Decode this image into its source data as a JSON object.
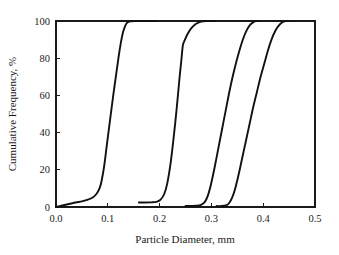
{
  "chart_data": {
    "type": "line",
    "title": "",
    "xlabel": "Particle Diameter, mm",
    "ylabel": "Cumulative Frequency, %",
    "xlim": [
      0.0,
      0.5
    ],
    "ylim": [
      0,
      100
    ],
    "xticks": [
      "0.0",
      "0.1",
      "0.2",
      "0.3",
      "0.4",
      "0.5"
    ],
    "xtick_values": [
      0.0,
      0.1,
      0.2,
      0.3,
      0.4,
      0.5
    ],
    "yticks": [
      "0",
      "20",
      "40",
      "60",
      "80",
      "100"
    ],
    "ytick_values": [
      0,
      20,
      40,
      60,
      80,
      100
    ],
    "grid": false,
    "legend": "none",
    "line_color": "#111111",
    "background_color": "#ffffff",
    "axis_color": "#1a1a1a",
    "series": [
      {
        "name": "Sample 1",
        "x": [
          0.0,
          0.012,
          0.025,
          0.038,
          0.05,
          0.06,
          0.07,
          0.078,
          0.084,
          0.088,
          0.093,
          0.098,
          0.104,
          0.11,
          0.116,
          0.121,
          0.125,
          0.129,
          0.133,
          0.137,
          0.143,
          0.152,
          0.165,
          0.18,
          0.195
        ],
        "y": [
          0.0,
          0.8,
          1.6,
          2.4,
          3.0,
          3.8,
          5.0,
          7.0,
          10.0,
          14.0,
          22.0,
          33.0,
          46.0,
          59.0,
          71.0,
          81.0,
          88.0,
          93.5,
          97.0,
          99.0,
          99.8,
          100.0,
          100.0,
          100.0,
          100.0
        ]
      },
      {
        "name": "Sample 2",
        "x": [
          0.16,
          0.172,
          0.184,
          0.194,
          0.202,
          0.209,
          0.215,
          0.221,
          0.227,
          0.233,
          0.238,
          0.242,
          0.245,
          0.249,
          0.254,
          0.261,
          0.269,
          0.277,
          0.284,
          0.292,
          0.3,
          0.308
        ],
        "y": [
          2.4,
          2.4,
          2.5,
          2.8,
          4.0,
          7.0,
          13.0,
          23.0,
          37.0,
          53.0,
          68.0,
          79.0,
          87.0,
          90.0,
          93.0,
          96.0,
          98.2,
          99.4,
          99.9,
          100.0,
          100.0,
          100.0
        ]
      },
      {
        "name": "Sample 3",
        "x": [
          0.25,
          0.262,
          0.272,
          0.28,
          0.287,
          0.293,
          0.299,
          0.306,
          0.313,
          0.32,
          0.327,
          0.334,
          0.341,
          0.348,
          0.355,
          0.362,
          0.369,
          0.375,
          0.381,
          0.386,
          0.392
        ],
        "y": [
          0.6,
          0.6,
          0.7,
          1.2,
          2.6,
          6.0,
          12.0,
          21.0,
          31.0,
          41.0,
          51.0,
          61.0,
          70.0,
          78.0,
          85.0,
          91.0,
          95.5,
          98.0,
          99.4,
          100.0,
          100.0
        ]
      },
      {
        "name": "Sample 4",
        "x": [
          0.31,
          0.32,
          0.328,
          0.334,
          0.34,
          0.346,
          0.353,
          0.36,
          0.367,
          0.374,
          0.381,
          0.388,
          0.395,
          0.402,
          0.409,
          0.416,
          0.423,
          0.43,
          0.437,
          0.443,
          0.448
        ],
        "y": [
          0.5,
          0.5,
          0.8,
          2.0,
          5.0,
          10.0,
          18.0,
          27.0,
          36.0,
          45.0,
          54.0,
          62.0,
          70.0,
          77.0,
          84.0,
          90.0,
          94.5,
          97.5,
          99.3,
          99.9,
          100.0
        ]
      }
    ]
  }
}
